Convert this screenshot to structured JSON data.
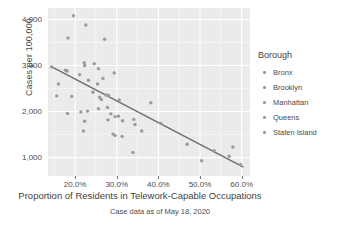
{
  "chart_data": {
    "type": "scatter",
    "title": "",
    "xlabel": "Proportion of Residents in Telework-Capable Occupations",
    "ylabel": "Cases per 100,000",
    "caption": "Case data as of May 18, 2020",
    "xlim": [
      13.5,
      62.0
    ],
    "ylim": [
      600,
      4250
    ],
    "xticks": [
      20.0,
      30.0,
      40.0,
      50.0,
      60.0
    ],
    "xtick_labels": [
      "20.0%",
      "30.0%",
      "40.0%",
      "50.0%",
      "60.0%"
    ],
    "yticks": [
      1000,
      2000,
      3000,
      4000
    ],
    "ytick_labels": [
      "1,000",
      "2,000",
      "3,000",
      "4,000"
    ],
    "grid": true,
    "panel_background": "#ebebeb",
    "grid_color": "#ffffff",
    "point_color": "#9a9a9a",
    "line_color": "#6e6e6e",
    "legend": {
      "title": "Borough",
      "position": "right",
      "entries": [
        {
          "label": "Bronx",
          "color": "#9a9a9a"
        },
        {
          "label": "Brooklyn",
          "color": "#9a9a9a"
        },
        {
          "label": "Manhattan",
          "color": "#9a9a9a"
        },
        {
          "label": "Queens",
          "color": "#9a9a9a"
        },
        {
          "label": "Staten Island",
          "color": "#9a9a9a"
        }
      ]
    },
    "trend_line": {
      "x": [
        14.2,
        60.3
      ],
      "y": [
        2980,
        800
      ]
    },
    "points": [
      {
        "x": 19.6,
        "y": 4080
      },
      {
        "x": 22.6,
        "y": 3880
      },
      {
        "x": 18.3,
        "y": 3600
      },
      {
        "x": 27.1,
        "y": 3570
      },
      {
        "x": 22.2,
        "y": 3060
      },
      {
        "x": 22.3,
        "y": 3000
      },
      {
        "x": 24.6,
        "y": 3040
      },
      {
        "x": 14.4,
        "y": 2970
      },
      {
        "x": 17.7,
        "y": 2900
      },
      {
        "x": 18.1,
        "y": 2880
      },
      {
        "x": 25.6,
        "y": 2930
      },
      {
        "x": 29.4,
        "y": 2840
      },
      {
        "x": 16.0,
        "y": 2600
      },
      {
        "x": 21.1,
        "y": 2800
      },
      {
        "x": 23.2,
        "y": 2680
      },
      {
        "x": 25.4,
        "y": 2600
      },
      {
        "x": 26.7,
        "y": 2720
      },
      {
        "x": 15.6,
        "y": 2340
      },
      {
        "x": 19.2,
        "y": 2330
      },
      {
        "x": 24.3,
        "y": 2420
      },
      {
        "x": 25.9,
        "y": 2310
      },
      {
        "x": 26.3,
        "y": 2260
      },
      {
        "x": 27.4,
        "y": 2360
      },
      {
        "x": 28.0,
        "y": 2350
      },
      {
        "x": 30.6,
        "y": 2250
      },
      {
        "x": 38.2,
        "y": 2190
      },
      {
        "x": 18.2,
        "y": 1960
      },
      {
        "x": 21.4,
        "y": 1990
      },
      {
        "x": 23.0,
        "y": 2010
      },
      {
        "x": 25.6,
        "y": 2060
      },
      {
        "x": 27.8,
        "y": 2090
      },
      {
        "x": 28.6,
        "y": 1950
      },
      {
        "x": 29.6,
        "y": 1890
      },
      {
        "x": 30.4,
        "y": 1900
      },
      {
        "x": 22.3,
        "y": 1790
      },
      {
        "x": 27.9,
        "y": 1820
      },
      {
        "x": 31.4,
        "y": 1800
      },
      {
        "x": 34.1,
        "y": 1830
      },
      {
        "x": 34.4,
        "y": 1720
      },
      {
        "x": 40.6,
        "y": 1740
      },
      {
        "x": 22.0,
        "y": 1580
      },
      {
        "x": 36.0,
        "y": 1580
      },
      {
        "x": 29.1,
        "y": 1510
      },
      {
        "x": 29.6,
        "y": 1480
      },
      {
        "x": 31.3,
        "y": 1460
      },
      {
        "x": 46.9,
        "y": 1290
      },
      {
        "x": 53.4,
        "y": 1150
      },
      {
        "x": 57.9,
        "y": 1230
      },
      {
        "x": 33.9,
        "y": 1110
      },
      {
        "x": 57.0,
        "y": 1030
      },
      {
        "x": 50.4,
        "y": 930
      },
      {
        "x": 59.7,
        "y": 850
      }
    ]
  }
}
